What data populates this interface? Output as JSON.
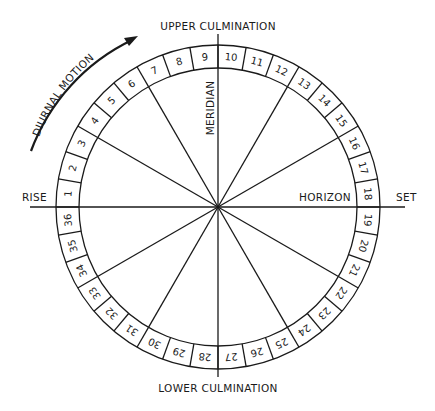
{
  "labels": {
    "top": "UPPER CULMINATION",
    "bottom": "LOWER CULMINATION",
    "left": "RISE",
    "right": "SET",
    "meridian": "MERIDIAN",
    "horizon": "HORIZON",
    "motion": "DIURNAL MOTION"
  },
  "dial": {
    "segments": 36,
    "numbers": [
      "1",
      "2",
      "3",
      "4",
      "5",
      "6",
      "7",
      "8",
      "9",
      "10",
      "11",
      "12",
      "13",
      "14",
      "15",
      "16",
      "17",
      "18",
      "19",
      "20",
      "21",
      "22",
      "23",
      "24",
      "25",
      "26",
      "27",
      "28",
      "29",
      "30",
      "31",
      "32",
      "33",
      "34",
      "35",
      "36"
    ],
    "spoke_every_degrees": 30,
    "line_color": "#1a1a1a"
  }
}
